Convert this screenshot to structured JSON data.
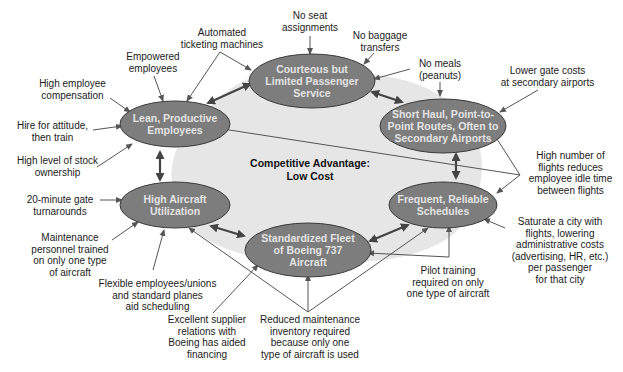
{
  "colors": {
    "node_fill": "#7d7d7d",
    "node_stroke": "#3a3a3a",
    "center_fill": "#e6e6e6",
    "line": "#555555",
    "node_text": "#e3e3e3"
  },
  "center": {
    "title": "Competitive Advantage:\nLow Cost"
  },
  "nodes": [
    {
      "id": "service",
      "label": "Courteous but\nLimited Passenger\nService"
    },
    {
      "id": "routes",
      "label": "Short Haul, Point-to-\nPoint Routes, Often to\nSecondary Airports"
    },
    {
      "id": "schedules",
      "label": "Frequent, Reliable\nSchedules"
    },
    {
      "id": "fleet",
      "label": "Standardized Fleet\nof Boeing 737\nAircraft"
    },
    {
      "id": "utilization",
      "label": "High Aircraft\nUtilization"
    },
    {
      "id": "employees",
      "label": "Lean, Productive\nEmployees"
    }
  ],
  "factors": [
    {
      "id": "no-seat",
      "text": "No seat\nassignments"
    },
    {
      "id": "no-baggage",
      "text": "No baggage\ntransfers"
    },
    {
      "id": "no-meals",
      "text": "No meals\n(peanuts)"
    },
    {
      "id": "gate-costs",
      "text": "Lower gate costs\nat secondary airports"
    },
    {
      "id": "idle-time",
      "text": "High number of\nflights reduces\nemployee idle time\nbetween flights"
    },
    {
      "id": "saturate",
      "text": "Saturate a city with\nflights, lowering\nadministrative costs\n(advertising, HR, etc.)\nper passenger\nfor that city"
    },
    {
      "id": "pilot",
      "text": "Pilot training\nrequired on only\none type of aircraft"
    },
    {
      "id": "maint-inventory",
      "text": "Reduced maintenance\ninventory required\nbecause only one\ntype of aircraft is used"
    },
    {
      "id": "supplier",
      "text": "Excellent supplier\nrelations with\nBoeing has aided\nfinancing"
    },
    {
      "id": "flexible",
      "text": "Flexible employees/unions\nand standard planes\naid scheduling"
    },
    {
      "id": "maint-personnel",
      "text": "Maintenance\npersonnel trained\non only one type\nof aircraft"
    },
    {
      "id": "gate-turn",
      "text": "20-minute gate\nturnarounds"
    },
    {
      "id": "stock",
      "text": "High level of stock\nownership"
    },
    {
      "id": "hire",
      "text": "Hire for attitude,\nthen train"
    },
    {
      "id": "compensation",
      "text": "High employee\ncompensation"
    },
    {
      "id": "empowered",
      "text": "Empowered\nemployees"
    },
    {
      "id": "ticketing",
      "text": "Automated\nticketing machines"
    }
  ]
}
